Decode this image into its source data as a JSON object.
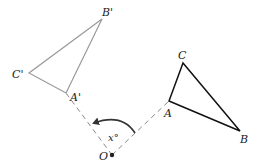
{
  "figure": {
    "center": {
      "label": "O",
      "x": 112,
      "y": 155
    },
    "original_triangle": {
      "color": "#111111",
      "vertices": [
        {
          "label": "A",
          "x": 169,
          "y": 101,
          "lx": 164,
          "ly": 116
        },
        {
          "label": "B",
          "x": 240,
          "y": 131,
          "lx": 240,
          "ly": 143
        },
        {
          "label": "C",
          "x": 183,
          "y": 63,
          "lx": 178,
          "ly": 59
        }
      ]
    },
    "image_triangle": {
      "color": "#9a9a9a",
      "vertices": [
        {
          "label": "A'",
          "x": 66,
          "y": 93,
          "lx": 70,
          "ly": 100
        },
        {
          "label": "B'",
          "x": 102,
          "y": 19,
          "lx": 103,
          "ly": 16
        },
        {
          "label": "C'",
          "x": 29,
          "y": 73,
          "lx": 14,
          "ly": 77
        }
      ]
    },
    "angle_label": "x°",
    "angle_label_pos": {
      "x": 108,
      "y": 140
    }
  }
}
